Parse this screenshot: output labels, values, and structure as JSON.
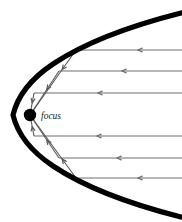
{
  "figure": {
    "type": "geometric-optics-diagram",
    "canvas": {
      "width": 182,
      "height": 222,
      "background": "#ffffff"
    },
    "labels": {
      "focus": "focus"
    },
    "colors": {
      "mirror": "#000000",
      "ray": "#6e6e6e",
      "reflected_ray": "#5a5a5a",
      "focus_dot": "#000000",
      "label_text": "#1a1a1a",
      "background": "#ffffff"
    },
    "focus_point": {
      "x": 30,
      "y": 115,
      "radius": 6.2
    },
    "focus_label_position": {
      "x": 41,
      "y": 119
    },
    "mirror": {
      "name": "parabola",
      "vertex": {
        "x": 13,
        "y": 115
      },
      "opens": "right",
      "stroke_width": 5.2,
      "directrix_x": -4,
      "path": "M 181 13 Q 98 34 53 64 Q 20 86 13 115 Q 20 144 53 166 Q 98 196 181 217"
    },
    "incoming_rays": [
      {
        "y": 50,
        "x_start": 182,
        "x_end": 76,
        "arrow_x": 138
      },
      {
        "y": 71,
        "x_start": 182,
        "x_end": 59,
        "arrow_x": 122
      },
      {
        "y": 93,
        "x_start": 182,
        "x_end": 34,
        "arrow_x": 98
      },
      {
        "y": 136,
        "x_start": 182,
        "x_end": 34,
        "arrow_x": 97
      },
      {
        "y": 158,
        "x_start": 182,
        "x_end": 59,
        "arrow_x": 117
      },
      {
        "y": 178,
        "x_start": 182,
        "x_end": 76,
        "arrow_x": 138
      }
    ],
    "reflected_rays": [
      {
        "from_x": 76,
        "from_y": 50,
        "to_x": 30,
        "to_y": 115,
        "arrow_t": 0.3
      },
      {
        "from_x": 59,
        "from_y": 71,
        "to_x": 30,
        "to_y": 115,
        "arrow_t": 0.42
      },
      {
        "from_x": 34,
        "from_y": 93,
        "to_x": 30,
        "to_y": 115,
        "arrow_t": 0.45
      },
      {
        "from_x": 34,
        "from_y": 136,
        "to_x": 30,
        "to_y": 115,
        "arrow_t": 0.45
      },
      {
        "from_x": 59,
        "from_y": 158,
        "to_x": 30,
        "to_y": 115,
        "arrow_t": 0.42
      },
      {
        "from_x": 76,
        "from_y": 178,
        "to_x": 30,
        "to_y": 115,
        "arrow_t": 0.3
      }
    ],
    "axis_ray": {
      "from_x": 182,
      "from_y": 115,
      "to_x": 13,
      "to_y": 115,
      "visible": false
    }
  }
}
